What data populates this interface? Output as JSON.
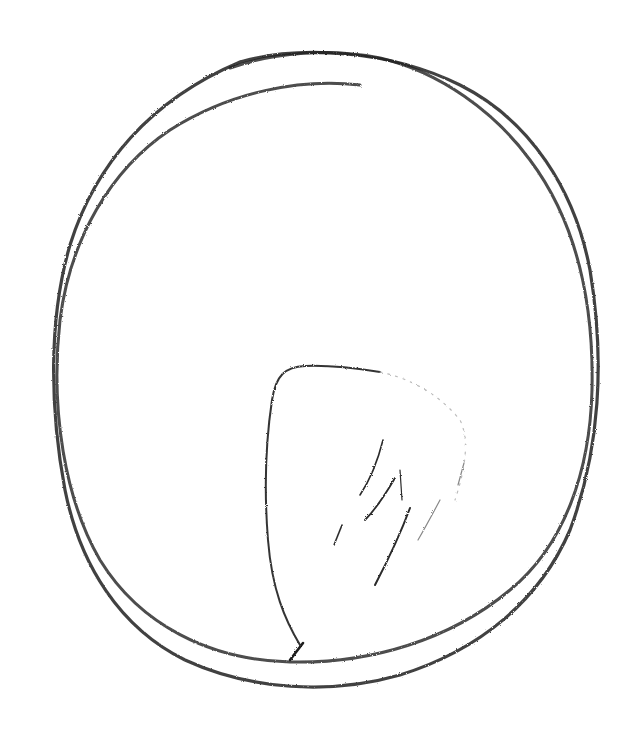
{
  "image": {
    "description": "Crayon/pencil sketch of a loose double-stroked oval with a faint teardrop/leaf-like shape and short hatch marks inside, on white paper",
    "background_color": "#ffffff",
    "stroke_color": "#1e1e1e",
    "hatch_color": "#2a2a2a",
    "elements": [
      "outer-oval-stroke",
      "inner-oval-stroke",
      "leaf-shape",
      "hatch-marks"
    ]
  }
}
